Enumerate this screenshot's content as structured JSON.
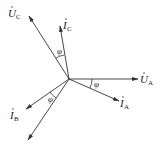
{
  "diagram": {
    "origin": [
      69,
      79
    ],
    "phasors": [
      {
        "id": "UA",
        "symbol": "U",
        "dot": true,
        "sub": "A",
        "labeled": true
      },
      {
        "id": "IA",
        "symbol": "I",
        "dot": true,
        "sub": "A",
        "labeled": true
      },
      {
        "id": "UC",
        "symbol": "U",
        "dot": true,
        "sub": "C",
        "labeled": true
      },
      {
        "id": "IC",
        "symbol": "I",
        "dot": true,
        "sub": "C",
        "labeled": true
      },
      {
        "id": "IB",
        "symbol": "I",
        "dot": true,
        "sub": "B",
        "labeled": true
      },
      {
        "id": "UB",
        "symbol": "U",
        "dot": true,
        "sub": "B",
        "labeled": false
      }
    ],
    "angle_label": "φ",
    "labels": {
      "ua_main": "U",
      "ua_sub": "A",
      "ia_main": "I",
      "ia_sub": "A",
      "uc_main": "U",
      "uc_sub": "C",
      "ic_main": "I",
      "ic_sub": "C",
      "ib_main": "I",
      "ib_sub": "B",
      "phi_a": "φ",
      "phi_b": "φ",
      "phi_c": "φ"
    }
  }
}
